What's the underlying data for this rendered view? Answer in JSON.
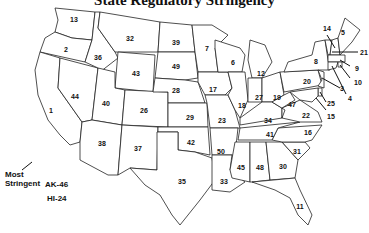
{
  "title": "State Regulatory Stringency",
  "annotation": {
    "most_stringent_line1": "Most",
    "most_stringent_line2": "Stringent"
  },
  "offmap": {
    "alaska": "AK-46",
    "hawaii": "HI-24"
  },
  "ranks": {
    "CA": "1",
    "OR": "2",
    "NJ": "3",
    "CT": "4",
    "ME": "5",
    "WI": "6",
    "MN": "7",
    "NY": "8",
    "MA": "9",
    "RI": "10",
    "FL": "11",
    "MI": "12",
    "WA": "13",
    "VT": "14",
    "MD": "15",
    "NC": "16",
    "IA": "17",
    "IL": "18",
    "OH": "19",
    "PA": "20",
    "NH": "21",
    "VA": "22",
    "MO": "23",
    "DE": "25",
    "CO": "26",
    "IN": "27",
    "NE": "28",
    "KS": "29",
    "GA": "30",
    "SC": "31",
    "MT": "32",
    "LA": "33",
    "KY": "34",
    "TX": "35",
    "ID": "36",
    "NM": "37",
    "AZ": "38",
    "ND": "39",
    "UT": "40",
    "TN": "41",
    "OK": "42",
    "WY": "43",
    "NV": "44",
    "MS": "45",
    "WV": "47",
    "AL": "48",
    "SD": "49",
    "AR": "50"
  }
}
